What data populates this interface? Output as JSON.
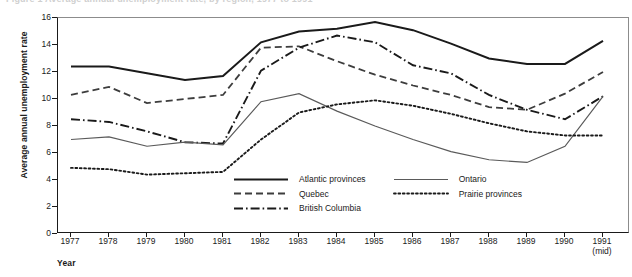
{
  "figure": {
    "title_sliver": "Figure 1  Average annual unemployment rate, by region, 1977 to 1991",
    "y_axis_title": "Average annual unemployment rate",
    "x_axis_title": "Year"
  },
  "axes": {
    "y_ticks": [
      "16",
      "14",
      "12",
      "10",
      "8",
      "6",
      "4",
      "2",
      "0"
    ],
    "x_ticks": [
      "1977",
      "1978",
      "1979",
      "1980",
      "1981",
      "1982",
      "1983",
      "1984",
      "1985",
      "1986",
      "1987",
      "1988",
      "1989",
      "1990",
      "1991"
    ],
    "x_last_sub": "(mid)"
  },
  "legend": {
    "items": [
      {
        "label": "Atlantic provinces",
        "style": "solid-thick",
        "color": "#1a1a1a"
      },
      {
        "label": "Ontario",
        "style": "solid-thin",
        "color": "#5a5a5a"
      },
      {
        "label": "Quebec",
        "style": "dashed",
        "color": "#3d3d3d"
      },
      {
        "label": "Prairie provinces",
        "style": "dotted",
        "color": "#1a1a1a"
      },
      {
        "label": "British Columbia",
        "style": "dash-dot",
        "color": "#1a1a1a"
      }
    ]
  },
  "chart_data": {
    "type": "line",
    "title": "Average annual unemployment rate, by region, 1977 to 1991",
    "xlabel": "Year",
    "ylabel": "Average annual unemployment rate",
    "x": [
      "1977",
      "1978",
      "1979",
      "1980",
      "1981",
      "1982",
      "1983",
      "1984",
      "1985",
      "1986",
      "1987",
      "1988",
      "1989",
      "1990",
      "1991"
    ],
    "xlim": [
      0,
      14
    ],
    "ylim": [
      0,
      16
    ],
    "ytick_step": 2,
    "grid": false,
    "legend_position": "inside-bottom-center",
    "series": [
      {
        "name": "Atlantic provinces",
        "style": "solid-thick",
        "color": "#1a1a1a",
        "values": [
          12.4,
          12.4,
          11.9,
          11.4,
          11.7,
          14.2,
          15.0,
          15.2,
          15.7,
          15.1,
          14.1,
          13.0,
          12.6,
          12.6,
          14.3
        ]
      },
      {
        "name": "Quebec",
        "style": "dashed",
        "color": "#3d3d3d",
        "values": [
          10.3,
          10.9,
          9.7,
          10.0,
          10.3,
          13.8,
          13.9,
          12.8,
          11.8,
          11.0,
          10.3,
          9.4,
          9.2,
          10.4,
          12.0
        ]
      },
      {
        "name": "British Columbia",
        "style": "dash-dot",
        "color": "#1a1a1a",
        "values": [
          8.5,
          8.3,
          7.6,
          6.8,
          6.7,
          12.1,
          13.8,
          14.7,
          14.2,
          12.5,
          11.9,
          10.3,
          9.2,
          8.5,
          10.2
        ]
      },
      {
        "name": "Ontario",
        "style": "solid-thin",
        "color": "#5a5a5a",
        "values": [
          7.0,
          7.2,
          6.5,
          6.8,
          6.6,
          9.8,
          10.4,
          9.1,
          8.0,
          7.0,
          6.1,
          5.5,
          5.3,
          6.5,
          10.2
        ]
      },
      {
        "name": "Prairie provinces",
        "style": "dotted",
        "color": "#1a1a1a",
        "values": [
          4.9,
          4.8,
          4.4,
          4.5,
          4.6,
          7.0,
          9.0,
          9.6,
          9.9,
          9.5,
          8.9,
          8.2,
          7.6,
          7.3,
          7.3
        ]
      }
    ]
  }
}
